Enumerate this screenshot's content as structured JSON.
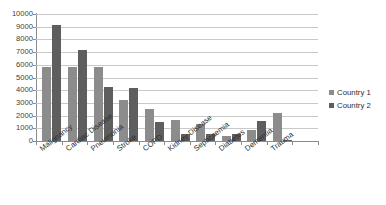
{
  "chart_data": {
    "type": "bar",
    "title": "",
    "xlabel": "",
    "ylabel": "",
    "ylim": [
      0,
      10000
    ],
    "ytick_step": 1000,
    "yticks": [
      "10000",
      "9000",
      "8000",
      "7000",
      "6000",
      "5000",
      "4000",
      "3000",
      "2000",
      "1000",
      "0"
    ],
    "grid": true,
    "legend_position": "right",
    "categories": [
      "Malignancy",
      "Cardiac Disease",
      "Pneumonia",
      "Stroke",
      "COPD",
      "Kidney Disease",
      "Septicaemia",
      "Diabetes",
      "Dementia",
      "Trauma"
    ],
    "series": [
      {
        "name": "Country 1",
        "color": "#8c8c8c",
        "values": [
          5800,
          5800,
          5800,
          3250,
          2500,
          1620,
          1320,
          380,
          850,
          2220
        ]
      },
      {
        "name": "Country 2",
        "color": "#5e5e5e",
        "values": [
          9100,
          7150,
          4280,
          4180,
          1500,
          520,
          580,
          550,
          1600,
          100
        ]
      }
    ]
  },
  "legend": {
    "items": [
      {
        "label": "Country 1",
        "color": "#8c8c8c"
      },
      {
        "label": "Country 2",
        "color": "#5e5e5e"
      }
    ]
  }
}
